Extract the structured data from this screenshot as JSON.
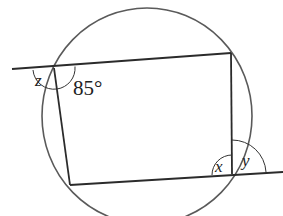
{
  "diagram": {
    "type": "cyclic-quadrilateral",
    "colors": {
      "stroke": "#2b2b2b",
      "circle": "#555555",
      "text": "#222222",
      "background": "#ffffff"
    },
    "circle": {
      "cx": 147,
      "cy": 116,
      "rx": 105,
      "ry": 108
    },
    "vertices": {
      "top_left": [
        54,
        68
      ],
      "top_right": [
        231,
        53
      ],
      "bottom_right": [
        232,
        174
      ],
      "bottom_left": [
        70,
        185
      ]
    },
    "extended_lines": {
      "top_extension_start": [
        12,
        69
      ],
      "bottom_extension_end": [
        283,
        172
      ]
    },
    "labels": {
      "angle_top_left_interior": "85°",
      "angle_top_left_exterior": "z",
      "angle_bottom_right_interior": "x",
      "angle_bottom_right_exterior": "y"
    }
  }
}
